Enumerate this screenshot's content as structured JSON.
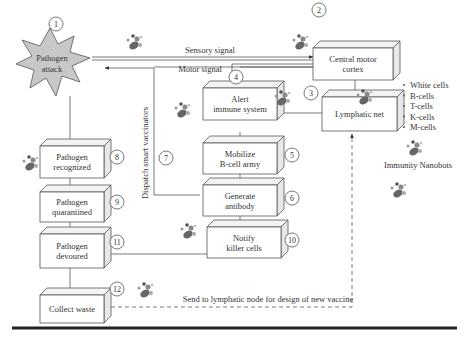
{
  "diagram": {
    "nodes": [
      {
        "id": 1,
        "label_lines": [
          "Pathogen",
          "attack"
        ],
        "shape": "starburst"
      },
      {
        "id": 2,
        "label_lines": [
          "Central motor",
          "cortex"
        ]
      },
      {
        "id": 3,
        "label_lines": [
          "Lymphatic net"
        ]
      },
      {
        "id": 4,
        "label_lines": [
          "Alert",
          "immune system"
        ]
      },
      {
        "id": 5,
        "label_lines": [
          "Mobilize",
          "B-cell army"
        ]
      },
      {
        "id": 6,
        "label_lines": [
          "Generate",
          "antibody"
        ]
      },
      {
        "id": 8,
        "label_lines": [
          "Pathogen",
          "recognized"
        ]
      },
      {
        "id": 9,
        "label_lines": [
          "Pathogen",
          "quarantined"
        ]
      },
      {
        "id": 10,
        "label_lines": [
          "Notify",
          "killer cells"
        ]
      },
      {
        "id": 11,
        "label_lines": [
          "Pathogen",
          "devoured"
        ]
      },
      {
        "id": 12,
        "label_lines": [
          "Collect waste"
        ]
      }
    ],
    "numbers": [
      "1",
      "2",
      "3",
      "4",
      "5",
      "6",
      "7",
      "8",
      "9",
      "10",
      "11",
      "12"
    ],
    "edge_labels": {
      "sensory": "Sensory signal",
      "motor": "Motor signal",
      "dispatch": "Dispatch smart vaccinators",
      "send": "Send to lymphatic node for design of new vaccine"
    },
    "legend": {
      "items": [
        "White cells",
        "B-cells",
        "T-cells",
        "K-cells",
        "M-cells"
      ],
      "caption": "Immunity Nanobots"
    }
  }
}
